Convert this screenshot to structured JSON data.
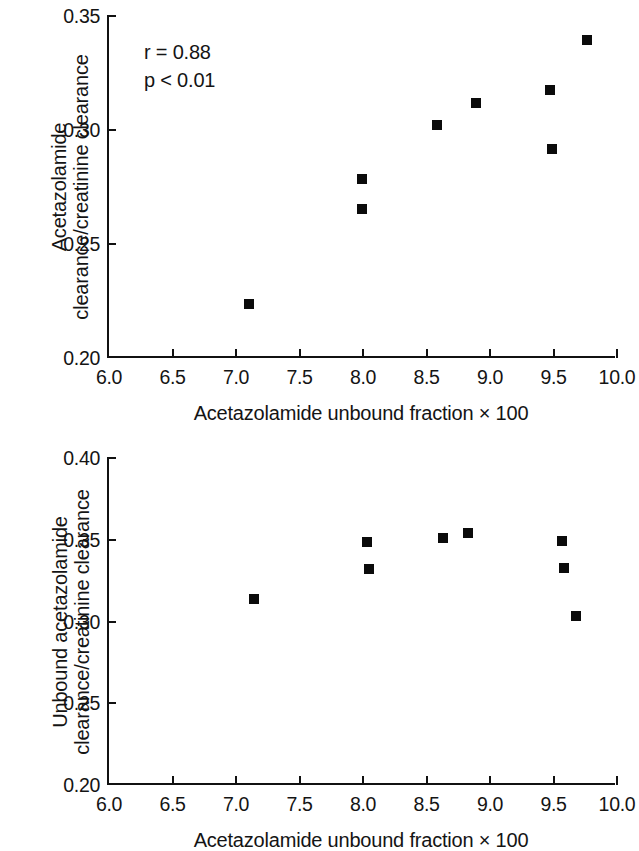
{
  "figure": {
    "panels": [
      {
        "id": "top",
        "annotation": {
          "correlation": "r = 0.88",
          "pvalue": "p < 0.01"
        }
      },
      {
        "id": "bottom"
      }
    ]
  },
  "chart_data": [
    {
      "type": "scatter",
      "panel": "top",
      "title": "",
      "xlabel": "Acetazolamide unbound fraction × 100",
      "ylabel": "Acetazolamide clearance/creatinine clearance",
      "ylabel_lines": [
        "Acetazolamide",
        "clearance/creatinine clearance"
      ],
      "xlim": [
        6.0,
        10.0
      ],
      "ylim": [
        0.2,
        0.35
      ],
      "xticks": [
        "6.0",
        "6.5",
        "7.0",
        "7.5",
        "8.0",
        "8.5",
        "9.0",
        "9.5",
        "10.0"
      ],
      "xtick_values": [
        6.0,
        6.5,
        7.0,
        7.5,
        8.0,
        8.5,
        9.0,
        9.5,
        10.0
      ],
      "yticks": [
        "0.20",
        "0.25",
        "0.30",
        "0.35"
      ],
      "ytick_values": [
        0.2,
        0.25,
        0.3,
        0.35
      ],
      "grid": false,
      "legend": "none",
      "marker": "filled-square",
      "marker_color": "#0b0b0b",
      "annotations": [
        "r = 0.88",
        "p < 0.01"
      ],
      "x": [
        7.1,
        7.99,
        7.99,
        8.58,
        8.89,
        9.47,
        9.49,
        9.76
      ],
      "y": [
        0.2235,
        0.2785,
        0.2655,
        0.302,
        0.312,
        0.3175,
        0.2915,
        0.3395
      ]
    },
    {
      "type": "scatter",
      "panel": "bottom",
      "title": "",
      "xlabel": "Acetazolamide unbound fraction × 100",
      "ylabel": "Unbound acetazolamide clearance/creatinine clearance",
      "ylabel_lines": [
        "Unbound acetazolamide",
        "clearance/creatinine clearance"
      ],
      "xlim": [
        6.0,
        10.0
      ],
      "ylim": [
        0.2,
        0.4
      ],
      "xticks": [
        "6.0",
        "6.5",
        "7.0",
        "7.5",
        "8.0",
        "8.5",
        "9.0",
        "9.5",
        "10.0"
      ],
      "xtick_values": [
        6.0,
        6.5,
        7.0,
        7.5,
        8.0,
        8.5,
        9.0,
        9.5,
        10.0
      ],
      "yticks": [
        "0.20",
        "0.25",
        "0.30",
        "0.35",
        "0.40"
      ],
      "ytick_values": [
        0.2,
        0.25,
        0.3,
        0.35,
        0.4
      ],
      "grid": false,
      "legend": "none",
      "marker": "filled-square",
      "marker_color": "#0b0b0b",
      "annotations": [],
      "x": [
        7.14,
        8.03,
        8.05,
        8.63,
        8.83,
        9.57,
        9.58,
        9.68
      ],
      "y": [
        0.3135,
        0.3485,
        0.332,
        0.351,
        0.354,
        0.349,
        0.333,
        0.3035
      ]
    }
  ]
}
